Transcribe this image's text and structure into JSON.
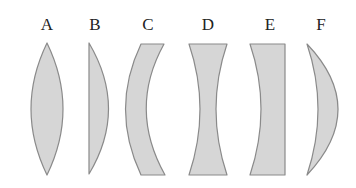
{
  "diagram": {
    "title": "",
    "colors": {
      "fill": "#d6d6d6",
      "stroke": "#8a8a8a",
      "label": "#222222",
      "background": "#ffffff"
    },
    "lenses": [
      {
        "label": "A",
        "shape": "biconvex",
        "label_x": 47
      },
      {
        "label": "B",
        "shape": "plano-convex",
        "label_x": 95
      },
      {
        "label": "C",
        "shape": "concave-convex meniscus",
        "label_x": 148
      },
      {
        "label": "D",
        "shape": "biconcave",
        "label_x": 208
      },
      {
        "label": "E",
        "shape": "plano-concave",
        "label_x": 270
      },
      {
        "label": "F",
        "shape": "convex-concave meniscus",
        "label_x": 321
      }
    ]
  }
}
